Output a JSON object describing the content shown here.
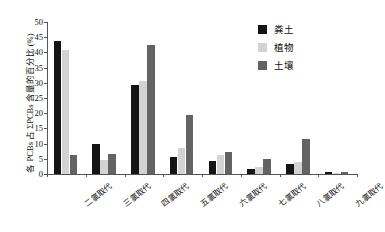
{
  "chart_data": {
    "type": "bar",
    "title": "",
    "xlabel": "",
    "ylabel": "各 PCBs 占 ΣPCBs 含量的百分比 (%)",
    "ylim": [
      0,
      50
    ],
    "yticks": [
      0,
      5,
      10,
      15,
      20,
      25,
      30,
      35,
      40,
      45,
      50
    ],
    "grid": false,
    "legend_position": "top-right",
    "categories": [
      "二氯取代",
      "三氯取代",
      "四氯取代",
      "五氯取代",
      "六氯取代",
      "七氯取代",
      "八氯取代",
      "九氯取代"
    ],
    "series": [
      {
        "name": "粪土",
        "color": "#141414",
        "values": [
          43.7,
          10.0,
          29.4,
          5.5,
          4.4,
          1.8,
          3.4,
          0.5
        ]
      },
      {
        "name": "植物",
        "color": "#d3d3d3",
        "values": [
          40.8,
          4.6,
          30.6,
          8.6,
          6.2,
          2.4,
          4.0,
          0.4
        ]
      },
      {
        "name": "土壤",
        "color": "#636363",
        "values": [
          6.1,
          6.5,
          42.4,
          19.4,
          7.3,
          4.9,
          11.4,
          0.6
        ]
      }
    ]
  }
}
